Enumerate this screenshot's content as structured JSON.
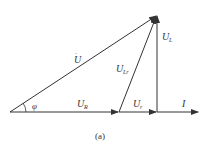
{
  "diagram": {
    "type": "phasor-diagram",
    "caption": "(a)",
    "angle_label": "φ",
    "phasors": [
      {
        "id": "U",
        "label": "U",
        "sub": "",
        "from": [
          10,
          112
        ],
        "to": [
          157,
          15
        ]
      },
      {
        "id": "U_R",
        "label": "U",
        "sub": "R",
        "from": [
          10,
          112
        ],
        "to": [
          119,
          112
        ]
      },
      {
        "id": "U_r",
        "label": "U",
        "sub": "r",
        "from": [
          119,
          112
        ],
        "to": [
          157,
          112
        ]
      },
      {
        "id": "U_L",
        "label": "U",
        "sub": "L",
        "from": [
          157,
          112
        ],
        "to": [
          157,
          15
        ]
      },
      {
        "id": "U_Lr",
        "label": "U",
        "sub": "Lr",
        "from": [
          119,
          112
        ],
        "to": [
          157,
          15
        ]
      },
      {
        "id": "I",
        "label": "I",
        "sub": "",
        "from": [
          157,
          112
        ],
        "to": [
          198,
          112
        ]
      }
    ],
    "color": "#333333"
  }
}
